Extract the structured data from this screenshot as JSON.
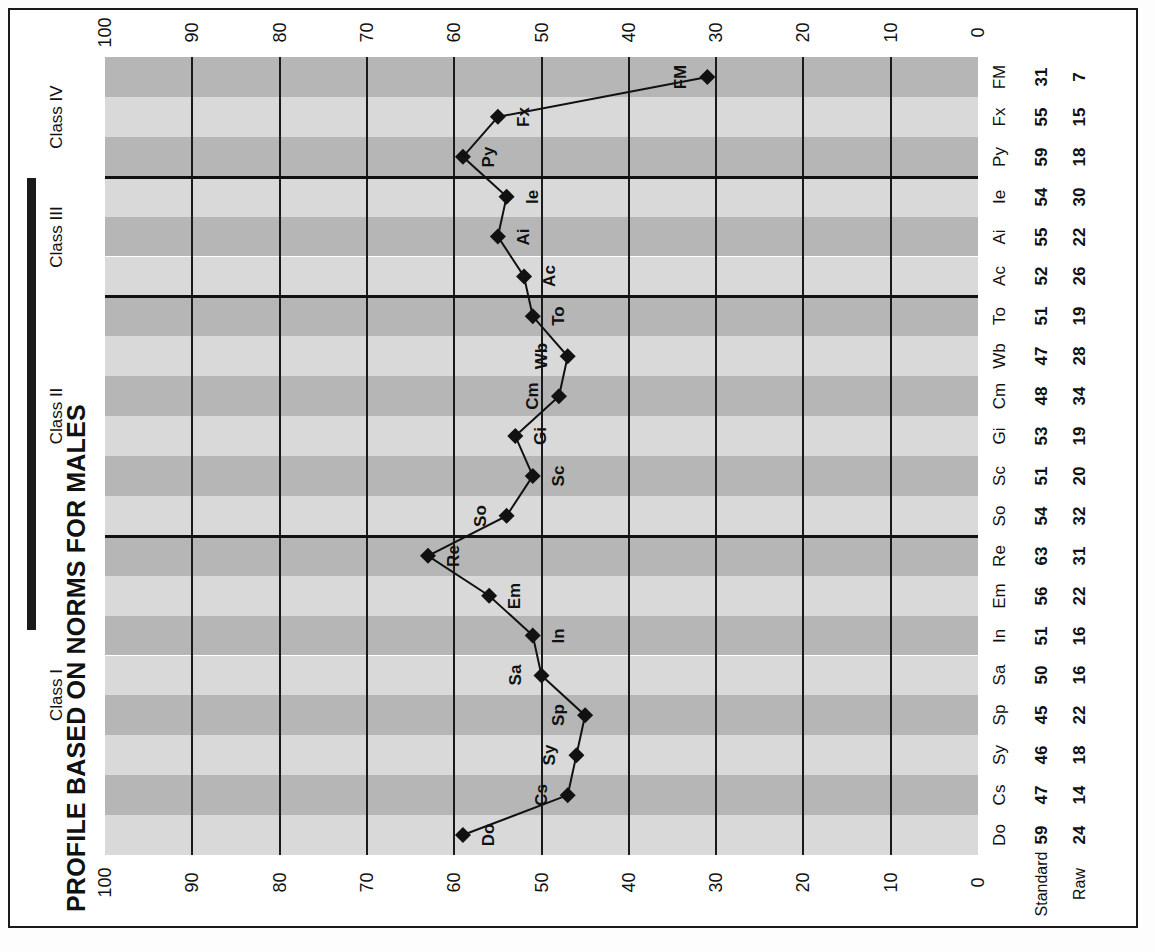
{
  "title": "PROFILE BASED ON NORMS FOR MALES",
  "row_headers": {
    "standard": "Standard",
    "raw": "Raw"
  },
  "classes": [
    {
      "label": "Class I",
      "start": 0,
      "count": 8
    },
    {
      "label": "Class II",
      "start": 8,
      "count": 6
    },
    {
      "label": "Class III",
      "start": 14,
      "count": 3
    },
    {
      "label": "Class IV",
      "start": 17,
      "count": 3
    }
  ],
  "chart_data": {
    "type": "line",
    "title": "PROFILE BASED ON NORMS FOR MALES",
    "xlabel": "",
    "ylabel": "",
    "ylim": [
      0,
      100
    ],
    "grid": true,
    "orientation": "horizontal-rotated",
    "axis_ticks": [
      100,
      90,
      80,
      70,
      60,
      50,
      40,
      30,
      20,
      10,
      0
    ],
    "categories": [
      "Do",
      "Cs",
      "Sy",
      "Sp",
      "Sa",
      "In",
      "Em",
      "Re",
      "So",
      "Sc",
      "Gi",
      "Cm",
      "Wb",
      "To",
      "Ac",
      "Ai",
      "Ie",
      "Py",
      "Fx",
      "FM"
    ],
    "series": [
      {
        "name": "Standard",
        "values": [
          59,
          47,
          46,
          45,
          50,
          51,
          56,
          63,
          54,
          51,
          53,
          48,
          47,
          51,
          52,
          55,
          54,
          59,
          55,
          31
        ]
      },
      {
        "name": "Raw",
        "values": [
          24,
          14,
          18,
          22,
          16,
          16,
          22,
          31,
          32,
          20,
          19,
          34,
          28,
          19,
          26,
          22,
          30,
          18,
          15,
          7
        ]
      }
    ]
  }
}
